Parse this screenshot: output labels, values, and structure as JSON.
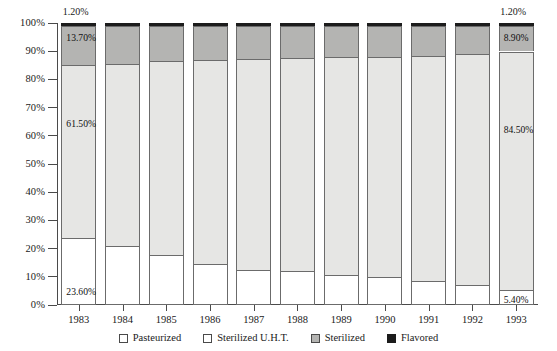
{
  "chart_data": {
    "type": "bar",
    "stacked": true,
    "normalized": true,
    "title": "",
    "xlabel": "",
    "ylabel": "",
    "ylim": [
      0,
      100
    ],
    "grid": false,
    "legend_position": "bottom",
    "categories": [
      "1983",
      "1984",
      "1985",
      "1986",
      "1987",
      "1988",
      "1989",
      "1990",
      "1991",
      "1992",
      "1993"
    ],
    "ytick_labels": [
      "0%",
      "10%",
      "20%",
      "30%",
      "40%",
      "50%",
      "60%",
      "70%",
      "80%",
      "90%",
      "100%"
    ],
    "ytick_values": [
      0,
      10,
      20,
      30,
      40,
      50,
      60,
      70,
      80,
      90,
      100
    ],
    "series": [
      {
        "name": "Pasteurized",
        "color": "#ffffff",
        "values": [
          23.6,
          20.8,
          17.8,
          14.6,
          12.5,
          12.0,
          10.5,
          9.8,
          8.5,
          7.0,
          5.4
        ]
      },
      {
        "name": "Sterilized U.H.T.",
        "color": "#e6e6e4",
        "values": [
          61.5,
          64.8,
          68.8,
          72.4,
          74.8,
          75.5,
          77.3,
          78.2,
          79.8,
          82.1,
          84.5
        ]
      },
      {
        "name": "Sterilized",
        "color": "#b4b4b2",
        "values": [
          13.7,
          13.2,
          12.2,
          11.8,
          11.5,
          11.3,
          11.0,
          10.8,
          10.5,
          9.7,
          8.9
        ]
      },
      {
        "name": "Flavored",
        "color": "#1c1c1c",
        "values": [
          1.2,
          1.2,
          1.2,
          1.2,
          1.2,
          1.2,
          1.2,
          1.2,
          1.2,
          1.2,
          1.2
        ]
      }
    ],
    "annotations": {
      "inside_labels": [
        {
          "category": "1983",
          "series": "Pasteurized",
          "text": "23.60%"
        },
        {
          "category": "1983",
          "series": "Sterilized U.H.T.",
          "text": "61.50%"
        },
        {
          "category": "1983",
          "series": "Sterilized",
          "text": "13.70%"
        },
        {
          "category": "1993",
          "series": "Pasteurized",
          "text": "5.40%"
        },
        {
          "category": "1993",
          "series": "Sterilized U.H.T.",
          "text": "84.50%"
        },
        {
          "category": "1993",
          "series": "Sterilized",
          "text": "8.90%"
        }
      ],
      "above_bar_labels": [
        {
          "category": "1983",
          "series": "Flavored",
          "text": "1.20%"
        },
        {
          "category": "1993",
          "series": "Flavored",
          "text": "1.20%"
        }
      ]
    }
  },
  "legend": {
    "items": [
      {
        "label": "Pasteurized",
        "swatch": "legend-swatch-pasteurized"
      },
      {
        "label": "Sterilized U.H.T.",
        "swatch": "legend-swatch-uht"
      },
      {
        "label": "Sterilized",
        "swatch": "legend-swatch-sterilized"
      },
      {
        "label": "Flavored",
        "swatch": "legend-swatch-flavored"
      }
    ]
  }
}
